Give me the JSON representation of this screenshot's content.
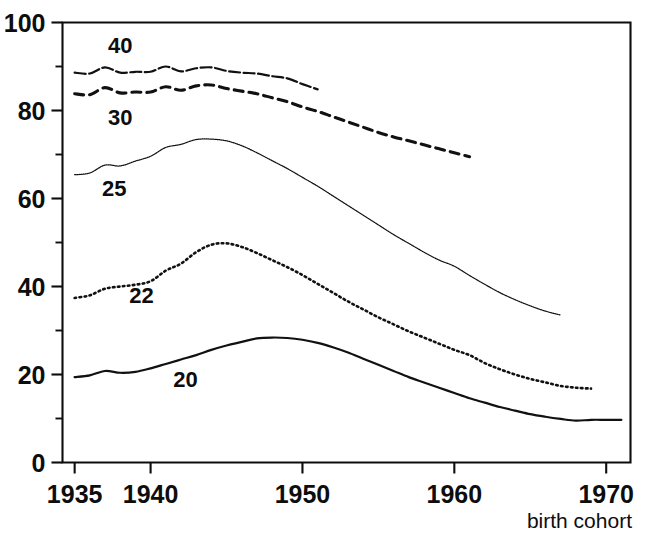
{
  "chart_data": {
    "type": "line",
    "title": "",
    "subtitle": "",
    "xlabel": "birth cohort",
    "ylabel": "",
    "xlim": [
      1934.2,
      1971.6
    ],
    "ylim": [
      0,
      100
    ],
    "grid": false,
    "legend": "inline-labels",
    "x_ticks": [
      1935,
      1940,
      1950,
      1960,
      1970
    ],
    "x_tick_labels": [
      "1935",
      "1940",
      "1950",
      "1960",
      "1970"
    ],
    "x_minor_ticks": [
      1945,
      1955,
      1965
    ],
    "y_ticks": [
      0,
      20,
      40,
      60,
      80,
      100
    ],
    "y_tick_labels": [
      "0",
      "20",
      "40",
      "60",
      "80",
      "100"
    ],
    "y_minor_ticks": [
      10,
      30,
      50,
      70,
      90
    ],
    "series": [
      {
        "name": "40",
        "label": "40",
        "style": "solid-wavy",
        "label_x": 1938.0,
        "label_y": 95.0,
        "x": [
          1935,
          1936,
          1937,
          1938,
          1939,
          1940,
          1941,
          1942,
          1943,
          1944,
          1945,
          1946,
          1947,
          1948,
          1949,
          1950,
          1951
        ],
        "values": [
          88.6,
          88.4,
          89.8,
          88.6,
          88.8,
          88.8,
          90.0,
          88.9,
          89.6,
          89.8,
          89.0,
          88.6,
          88.4,
          87.8,
          87.3,
          86.0,
          84.8
        ]
      },
      {
        "name": "30",
        "label": "30",
        "style": "dashed",
        "label_x": 1938.0,
        "label_y": 78.5,
        "x": [
          1935,
          1936,
          1937,
          1938,
          1939,
          1940,
          1941,
          1942,
          1943,
          1944,
          1945,
          1946,
          1947,
          1948,
          1949,
          1950,
          1951,
          1952,
          1953,
          1954,
          1955,
          1956,
          1957,
          1958,
          1959,
          1960,
          1961
        ],
        "values": [
          83.8,
          83.6,
          85.2,
          84.0,
          84.2,
          84.2,
          85.4,
          84.6,
          85.6,
          85.8,
          85.0,
          84.4,
          83.8,
          82.9,
          82.0,
          80.8,
          79.8,
          78.6,
          77.4,
          76.2,
          75.0,
          74.0,
          73.1,
          72.2,
          71.3,
          70.4,
          69.5
        ]
      },
      {
        "name": "25",
        "label": "25",
        "style": "fine-dotted",
        "label_x": 1937.6,
        "label_y": 62.5,
        "x": [
          1935,
          1936,
          1937,
          1938,
          1939,
          1940,
          1941,
          1942,
          1943,
          1944,
          1945,
          1946,
          1947,
          1948,
          1949,
          1950,
          1951,
          1952,
          1953,
          1954,
          1955,
          1956,
          1957,
          1958,
          1959,
          1960,
          1961,
          1962,
          1963,
          1964,
          1965,
          1966,
          1967
        ],
        "values": [
          65.4,
          65.8,
          67.6,
          67.4,
          68.5,
          69.6,
          71.6,
          72.3,
          73.4,
          73.5,
          73.1,
          72.0,
          70.4,
          68.6,
          66.8,
          64.8,
          62.8,
          60.6,
          58.4,
          56.2,
          54.0,
          51.8,
          49.8,
          47.8,
          46.0,
          44.6,
          42.5,
          40.5,
          38.6,
          37.0,
          35.6,
          34.4,
          33.5
        ]
      },
      {
        "name": "22",
        "label": "22",
        "style": "dotted",
        "label_x": 1939.4,
        "label_y": 38.0,
        "x": [
          1935,
          1936,
          1937,
          1938,
          1939,
          1940,
          1941,
          1942,
          1943,
          1944,
          1945,
          1946,
          1947,
          1948,
          1949,
          1950,
          1951,
          1952,
          1953,
          1954,
          1955,
          1956,
          1957,
          1958,
          1959,
          1960,
          1961,
          1962,
          1963,
          1964,
          1965,
          1966,
          1967,
          1968,
          1969
        ],
        "values": [
          37.4,
          38.0,
          39.5,
          40.0,
          40.4,
          41.2,
          43.6,
          45.2,
          47.8,
          49.5,
          49.8,
          49.0,
          47.6,
          46.0,
          44.4,
          42.6,
          40.6,
          38.6,
          36.6,
          34.8,
          33.0,
          31.4,
          29.8,
          28.4,
          27.0,
          25.6,
          24.4,
          22.6,
          21.2,
          20.0,
          19.0,
          18.2,
          17.4,
          17.0,
          16.8
        ]
      },
      {
        "name": "20",
        "label": "20",
        "style": "solid",
        "label_x": 1942.3,
        "label_y": 19.0,
        "x": [
          1935,
          1936,
          1937,
          1938,
          1939,
          1940,
          1941,
          1942,
          1943,
          1944,
          1945,
          1946,
          1947,
          1948,
          1949,
          1950,
          1951,
          1952,
          1953,
          1954,
          1955,
          1956,
          1957,
          1958,
          1959,
          1960,
          1961,
          1962,
          1963,
          1964,
          1965,
          1966,
          1967,
          1968,
          1969,
          1970,
          1971
        ],
        "values": [
          19.4,
          19.8,
          20.8,
          20.4,
          20.6,
          21.4,
          22.4,
          23.4,
          24.4,
          25.6,
          26.6,
          27.4,
          28.2,
          28.4,
          28.3,
          27.9,
          27.2,
          26.2,
          25.0,
          23.6,
          22.2,
          20.8,
          19.4,
          18.2,
          17.0,
          15.8,
          14.6,
          13.6,
          12.6,
          11.8,
          11.0,
          10.4,
          9.9,
          9.5,
          9.7,
          9.7,
          9.7
        ]
      }
    ]
  }
}
